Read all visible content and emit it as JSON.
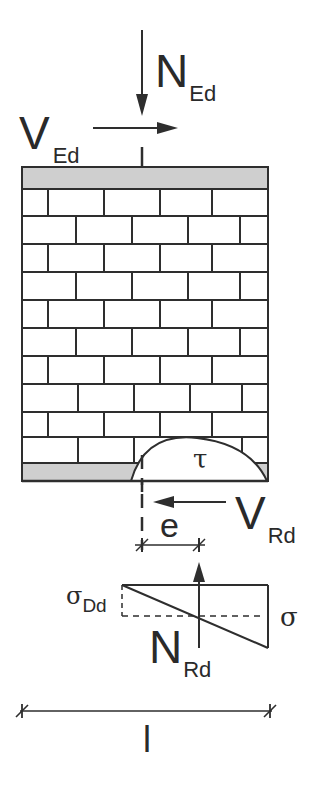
{
  "diagram": {
    "colors": {
      "line": "#2e2e2e",
      "bond_beam_fill": "#cfcfcf",
      "background": "#ffffff"
    },
    "loads": {
      "axial_design": {
        "main": "N",
        "sub": "Ed"
      },
      "shear_design": {
        "main": "V",
        "sub": "Ed"
      }
    },
    "resistances": {
      "shear_resistance": {
        "main": "V",
        "sub": "Rd"
      },
      "axial_resistance": {
        "main": "N",
        "sub": "Rd"
      }
    },
    "stress": {
      "shear_stress": "τ",
      "design_compressive": {
        "main": "σ",
        "sub": "Dd"
      },
      "normal_stress": "σ"
    },
    "dimensions": {
      "eccentricity": "e",
      "wall_length": "l"
    },
    "wall": {
      "brick_rows": 10
    }
  }
}
